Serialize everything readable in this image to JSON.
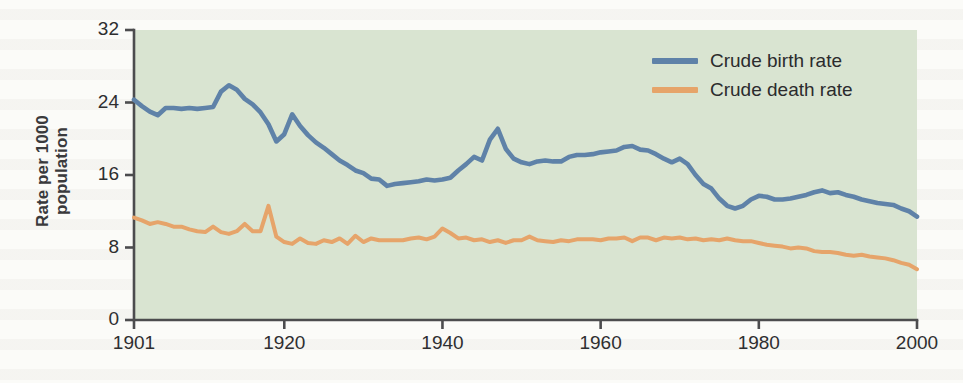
{
  "figure": {
    "name": "crude-birth-and-death-rate-chart",
    "plot_bg_color": "#d9e4d1",
    "page_bg_color": "#fbfbf8",
    "axis_color": "#4c4c4e"
  },
  "legend": {
    "position": "top-right",
    "items": [
      {
        "label": "Crude birth rate",
        "color": "#5f82a8"
      },
      {
        "label": "Crude death rate",
        "color": "#e6a46a"
      }
    ]
  },
  "axes": {
    "y_title_line1": "Rate per 1000",
    "y_title_line2": "population",
    "y_ticks": [
      "0",
      "8",
      "16",
      "24",
      "32"
    ],
    "x_ticks": [
      "1901",
      "1920",
      "1940",
      "1960",
      "1980",
      "2000"
    ]
  },
  "chart_data": {
    "type": "line",
    "title": "",
    "xlabel": "",
    "ylabel": "Rate per 1000 population",
    "xlim": [
      1901,
      2000
    ],
    "ylim": [
      0,
      32
    ],
    "yticks": [
      0,
      8,
      16,
      24,
      32
    ],
    "xticks": [
      1901,
      1920,
      1940,
      1960,
      1980,
      2000
    ],
    "grid": false,
    "legend_position": "top-right",
    "x": [
      1901,
      1902,
      1903,
      1904,
      1905,
      1906,
      1907,
      1908,
      1909,
      1910,
      1911,
      1912,
      1913,
      1914,
      1915,
      1916,
      1917,
      1918,
      1919,
      1920,
      1921,
      1922,
      1923,
      1924,
      1925,
      1926,
      1927,
      1928,
      1929,
      1930,
      1931,
      1932,
      1933,
      1934,
      1935,
      1936,
      1937,
      1938,
      1939,
      1940,
      1941,
      1942,
      1943,
      1944,
      1945,
      1946,
      1947,
      1948,
      1949,
      1950,
      1951,
      1952,
      1953,
      1954,
      1955,
      1956,
      1957,
      1958,
      1959,
      1960,
      1961,
      1962,
      1963,
      1964,
      1965,
      1966,
      1967,
      1968,
      1969,
      1970,
      1971,
      1972,
      1973,
      1974,
      1975,
      1976,
      1977,
      1978,
      1979,
      1980,
      1981,
      1982,
      1983,
      1984,
      1985,
      1986,
      1987,
      1988,
      1989,
      1990,
      1991,
      1992,
      1993,
      1994,
      1995,
      1996,
      1997,
      1998,
      1999,
      2000
    ],
    "series": [
      {
        "name": "Crude birth rate",
        "color": "#5f82a8",
        "values": [
          24.3,
          23.6,
          23.0,
          22.6,
          23.4,
          23.4,
          23.3,
          23.4,
          23.3,
          23.4,
          23.5,
          25.2,
          25.9,
          25.4,
          24.4,
          23.8,
          22.9,
          21.6,
          19.7,
          20.5,
          22.7,
          21.4,
          20.4,
          19.6,
          19.0,
          18.3,
          17.6,
          17.1,
          16.5,
          16.2,
          15.6,
          15.5,
          14.8,
          15.0,
          15.1,
          15.2,
          15.3,
          15.5,
          15.4,
          15.5,
          15.7,
          16.5,
          17.2,
          18.0,
          17.6,
          19.9,
          21.1,
          18.9,
          17.8,
          17.4,
          17.2,
          17.5,
          17.6,
          17.5,
          17.5,
          18.0,
          18.2,
          18.2,
          18.3,
          18.5,
          18.6,
          18.7,
          19.1,
          19.2,
          18.8,
          18.7,
          18.3,
          17.8,
          17.4,
          17.8,
          17.2,
          16.0,
          15.0,
          14.5,
          13.4,
          12.6,
          12.3,
          12.6,
          13.3,
          13.7,
          13.6,
          13.3,
          13.3,
          13.4,
          13.6,
          13.8,
          14.1,
          14.3,
          14.0,
          14.1,
          13.8,
          13.6,
          13.3,
          13.1,
          12.9,
          12.8,
          12.7,
          12.3,
          12.0,
          11.4
        ]
      },
      {
        "name": "Crude death rate",
        "color": "#e6a46a",
        "values": [
          11.3,
          11.0,
          10.6,
          10.8,
          10.6,
          10.3,
          10.3,
          10.0,
          9.8,
          9.7,
          10.3,
          9.7,
          9.5,
          9.8,
          10.6,
          9.8,
          9.8,
          12.6,
          9.2,
          8.6,
          8.4,
          9.0,
          8.5,
          8.4,
          8.8,
          8.6,
          9.0,
          8.4,
          9.3,
          8.6,
          9.0,
          8.8,
          8.8,
          8.8,
          8.8,
          9.0,
          9.1,
          8.9,
          9.2,
          10.1,
          9.6,
          9.0,
          9.1,
          8.8,
          8.9,
          8.6,
          8.8,
          8.5,
          8.8,
          8.8,
          9.2,
          8.8,
          8.7,
          8.6,
          8.8,
          8.7,
          8.9,
          8.9,
          8.9,
          8.8,
          9.0,
          9.0,
          9.1,
          8.7,
          9.1,
          9.1,
          8.8,
          9.1,
          9.0,
          9.1,
          8.9,
          9.0,
          8.8,
          8.9,
          8.8,
          9.0,
          8.8,
          8.7,
          8.7,
          8.5,
          8.3,
          8.2,
          8.1,
          7.9,
          8.0,
          7.9,
          7.6,
          7.5,
          7.5,
          7.4,
          7.2,
          7.1,
          7.2,
          7.0,
          6.9,
          6.8,
          6.6,
          6.3,
          6.1,
          5.6
        ]
      }
    ]
  }
}
